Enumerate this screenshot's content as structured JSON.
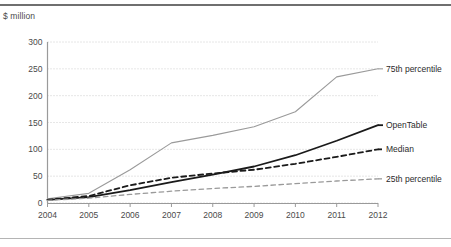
{
  "figure": {
    "unit_label": "$ million",
    "top_rule_color": "#6f6f6f",
    "bottom_rule_color": "#b4b4b4",
    "background": "#ffffff"
  },
  "chart_data": {
    "type": "line",
    "title": "",
    "subtitle": "",
    "xlabel": "",
    "ylabel": "$ million",
    "categories": [
      "2004",
      "2005",
      "2006",
      "2007",
      "2008",
      "2009",
      "2010",
      "2011",
      "2012"
    ],
    "x": [
      2004,
      2005,
      2006,
      2007,
      2008,
      2009,
      2010,
      2011,
      2012
    ],
    "xlim": [
      2004,
      2012
    ],
    "ylim": [
      0,
      300
    ],
    "yticks": [
      0,
      50,
      100,
      150,
      200,
      250,
      300
    ],
    "ytick_labels": [
      "0",
      "50",
      "100",
      "150",
      "200",
      "250",
      "300"
    ],
    "grid": true,
    "grid_style": "dotted",
    "grid_color": "#c8c8c8",
    "legend": "right-of-lines",
    "series": [
      {
        "name": "75th percentile",
        "color": "#9a9a9a",
        "style": "solid",
        "width": 1.1,
        "label": "75th percentile",
        "values": [
          8,
          18,
          62,
          112,
          126,
          142,
          170,
          235,
          250
        ]
      },
      {
        "name": "OpenTable",
        "color": "#1a1a1a",
        "style": "solid",
        "width": 1.8,
        "label": "OpenTable",
        "values": [
          6,
          11,
          24,
          39,
          53,
          68,
          89,
          116,
          145
        ]
      },
      {
        "name": "Median",
        "color": "#1a1a1a",
        "style": "dashed",
        "width": 1.8,
        "label": "Median",
        "values": [
          6,
          13,
          33,
          47,
          55,
          62,
          73,
          86,
          100
        ]
      },
      {
        "name": "25th percentile",
        "color": "#9a9a9a",
        "style": "dashed",
        "width": 1.3,
        "label": "25th percentile",
        "values": [
          5,
          9,
          16,
          22,
          27,
          31,
          36,
          41,
          45
        ]
      }
    ]
  }
}
